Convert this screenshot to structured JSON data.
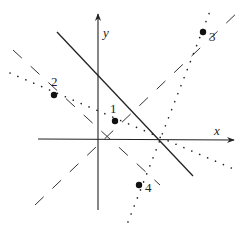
{
  "diagram": {
    "axes": {
      "x_label": "x",
      "y_label": "y"
    },
    "lines": [
      {
        "id": "solid-line",
        "style": "solid"
      },
      {
        "id": "dashed-line-rising",
        "style": "dashed"
      },
      {
        "id": "dashed-line-falling",
        "style": "dashed"
      },
      {
        "id": "dotted-line-shallow",
        "style": "dotted"
      },
      {
        "id": "dotted-line-steep",
        "style": "dotted"
      }
    ],
    "points": [
      {
        "label": "1"
      },
      {
        "label": "2"
      },
      {
        "label": "3"
      },
      {
        "label": "4"
      }
    ],
    "colors": {
      "ink": "#222222",
      "background": "#ffffff"
    }
  }
}
